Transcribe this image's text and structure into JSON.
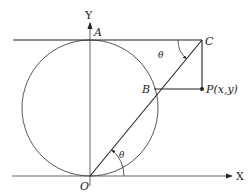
{
  "diagram": {
    "labels": {
      "y_axis": "Y",
      "x_axis": "X",
      "origin": "O",
      "point_a": "A",
      "point_b": "B",
      "point_c": "C",
      "point_p": "P(x,y)",
      "angle_top": "θ",
      "angle_bottom": "θ"
    },
    "colors": {
      "stroke": "#222222",
      "circle": "#444444",
      "background": "#ffffff"
    }
  }
}
